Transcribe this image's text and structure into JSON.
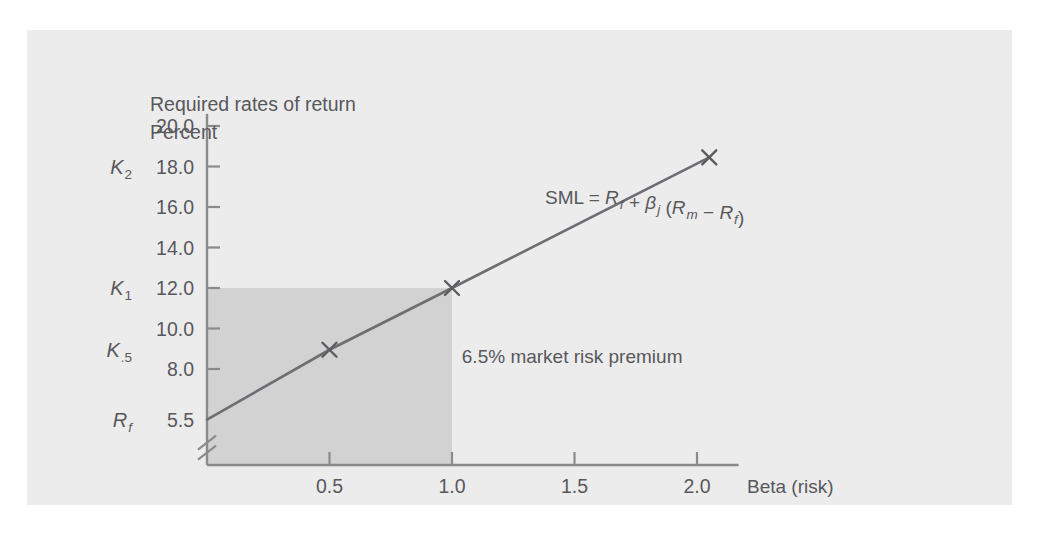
{
  "figure": {
    "panel_background": "#ececed",
    "page_background": "#ffffff",
    "ink_color": "#58585c",
    "line_color": "#6e6e72",
    "shade_color": "#d2d2d3"
  },
  "chart_data": {
    "type": "line",
    "title": "Required rates of return",
    "ylabel": "Percent",
    "xlabel": "Beta (risk)",
    "grid": false,
    "legend": null,
    "xlim": [
      0,
      2.17
    ],
    "ylim": [
      4.5,
      20.8
    ],
    "y_axis_break": true,
    "ytick_labels": [
      "20.0",
      "18.0",
      "16.0",
      "14.0",
      "12.0",
      "10.0",
      "8.0",
      "5.5"
    ],
    "ytick_values": [
      20.0,
      18.0,
      16.0,
      14.0,
      12.0,
      10.0,
      8.0,
      5.5
    ],
    "xtick_labels": [
      "0.5",
      "1.0",
      "1.5",
      "2.0"
    ],
    "xtick_values": [
      0.5,
      1.0,
      1.5,
      2.0
    ],
    "symbol_labels": [
      {
        "name": "K2",
        "base": "K",
        "sub": "2",
        "sub_italic": false,
        "value": 18.0
      },
      {
        "name": "K1",
        "base": "K",
        "sub": "1",
        "sub_italic": false,
        "value": 12.0
      },
      {
        "name": "K.5",
        "base": "K",
        "sub": ".5",
        "sub_italic": false,
        "value": 8.95
      },
      {
        "name": "Rf",
        "base": "R",
        "sub": "f",
        "sub_italic": true,
        "value": 5.5
      }
    ],
    "series": [
      {
        "name": "SML",
        "x": [
          0.0,
          0.5,
          1.0,
          2.05
        ],
        "y": [
          5.5,
          8.95,
          12.0,
          18.45
        ],
        "markers_at": [
          0.5,
          1.0,
          2.05
        ],
        "marker": "x"
      }
    ],
    "shaded_region": {
      "name": "market-risk-premium",
      "x_range": [
        0.0,
        1.0
      ],
      "y_range": [
        4.5,
        12.0
      ]
    },
    "annotations": [
      {
        "name": "premium-annotation",
        "text": "6.5% market risk premium",
        "x": 1.04,
        "y": 8.3
      }
    ],
    "formula": {
      "lead": "SML = ",
      "rf_base": "R",
      "rf_sub": "f",
      "plus": " + ",
      "beta_base": "β",
      "beta_sub": "j",
      "open_paren": " (",
      "rm_base": "R",
      "rm_sub": "m",
      "minus": " − ",
      "rf2_base": "R",
      "rf2_sub": "f",
      "close_paren": ")",
      "x": 1.38,
      "y": 16.15
    }
  }
}
